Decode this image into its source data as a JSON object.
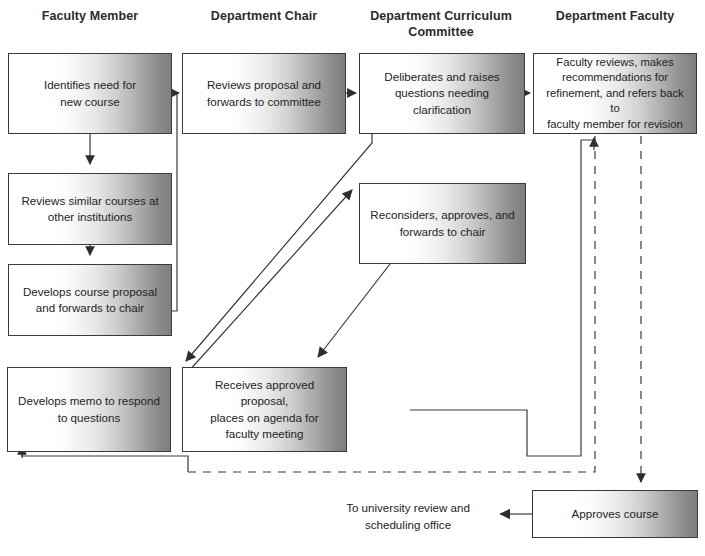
{
  "diagram": {
    "type": "swimlane-flowchart",
    "columns": [
      {
        "id": "faculty-member",
        "label": "Faculty Member",
        "center_x": 90
      },
      {
        "id": "department-chair",
        "label": "Department Chair",
        "center_x": 264
      },
      {
        "id": "department-curriculum-committee",
        "label": "Department Curriculum\nCommittee",
        "center_x": 441
      },
      {
        "id": "department-faculty",
        "label": "Department Faculty",
        "center_x": 615
      }
    ],
    "nodes": [
      {
        "id": "identifies-need",
        "column": "faculty-member",
        "text": "Identifies need for\nnew course",
        "x": 8,
        "y": 53,
        "w": 164,
        "h": 81
      },
      {
        "id": "reviews-similar-courses",
        "column": "faculty-member",
        "text": "Reviews similar courses at\nother institutions",
        "x": 8,
        "y": 173,
        "w": 164,
        "h": 72
      },
      {
        "id": "develops-course-proposal",
        "column": "faculty-member",
        "text": "Develops course proposal\nand forwards to chair",
        "x": 8,
        "y": 264,
        "w": 164,
        "h": 72
      },
      {
        "id": "develops-memo",
        "column": "faculty-member",
        "text": "Develops memo to respond\nto questions",
        "x": 7,
        "y": 367,
        "w": 164,
        "h": 85
      },
      {
        "id": "reviews-proposal",
        "column": "department-chair",
        "text": "Reviews proposal and\nforwards to committee",
        "x": 182,
        "y": 53,
        "w": 164,
        "h": 81
      },
      {
        "id": "receives-approved-proposal",
        "column": "department-chair",
        "text": "Receives approved proposal,\nplaces on agenda for\nfaculty meeting",
        "x": 182,
        "y": 367,
        "w": 165,
        "h": 85
      },
      {
        "id": "deliberates-raises-questions",
        "column": "department-curriculum-committee",
        "text": "Deliberates and raises\nquestions needing\nclarification",
        "x": 359,
        "y": 53,
        "w": 166,
        "h": 81
      },
      {
        "id": "reconsiders-approves",
        "column": "department-curriculum-committee",
        "text": "Reconsiders, approves, and\nforwards to chair",
        "x": 359,
        "y": 183,
        "w": 167,
        "h": 81
      },
      {
        "id": "faculty-reviews",
        "column": "department-faculty",
        "text": "Faculty reviews, makes\nrecommendations for\nrefinement, and refers back to\nfaculty member for revision",
        "x": 533,
        "y": 53,
        "w": 164,
        "h": 81
      },
      {
        "id": "approves-course",
        "column": "department-faculty",
        "text": "Approves course",
        "x": 532,
        "y": 490,
        "w": 166,
        "h": 48
      }
    ],
    "labels": [
      {
        "id": "to-university-review",
        "text": "To university review and\nscheduling office",
        "x": 318,
        "y": 500,
        "w": 180
      }
    ],
    "connectors": [
      {
        "id": "identifies-to-reviews-similar",
        "from": "identifies-need",
        "to": "reviews-similar-courses",
        "style": "solid",
        "arrow": "down"
      },
      {
        "id": "reviews-similar-to-develops-proposal",
        "from": "reviews-similar-courses",
        "to": "develops-course-proposal",
        "style": "solid",
        "arrow": "down"
      },
      {
        "id": "develops-proposal-to-chair",
        "from": "develops-course-proposal",
        "to": "reviews-proposal",
        "style": "solid",
        "arrow": "right"
      },
      {
        "id": "chair-to-committee",
        "from": "reviews-proposal",
        "to": "deliberates-raises-questions",
        "style": "solid",
        "arrow": "right"
      },
      {
        "id": "committee-to-faculty-reviews",
        "from": "deliberates-raises-questions",
        "to": "faculty-reviews",
        "style": "solid",
        "arrow": "right"
      },
      {
        "id": "committee-questions-to-memo",
        "from": "deliberates-raises-questions",
        "to": "develops-memo",
        "style": "solid-diagonal",
        "arrow": "down-left"
      },
      {
        "id": "memo-to-reconsiders",
        "from": "develops-memo",
        "to": "reconsiders-approves",
        "style": "solid-diagonal",
        "arrow": "up-right"
      },
      {
        "id": "reconsiders-to-receives",
        "from": "reconsiders-approves",
        "to": "receives-approved-proposal",
        "style": "solid-diagonal",
        "arrow": "down-left"
      },
      {
        "id": "receives-to-faculty-reviews",
        "from": "receives-approved-proposal",
        "to": "faculty-reviews",
        "style": "solid",
        "arrow": "up"
      },
      {
        "id": "faculty-reviews-back-to-memo",
        "from": "faculty-reviews",
        "to": "develops-memo",
        "style": "dashed",
        "arrow": "up"
      },
      {
        "id": "faculty-reviews-to-approves",
        "from": "faculty-reviews",
        "to": "approves-course",
        "style": "dashed",
        "arrow": "down"
      },
      {
        "id": "approves-to-university-office",
        "from": "approves-course",
        "to": "to-university-review",
        "style": "solid",
        "arrow": "left"
      }
    ],
    "colors": {
      "box_border": "#3a3a3a",
      "box_fill_light": "#ffffff",
      "box_fill_dark": "#7e7e7e",
      "line": "#3a3a3a",
      "text": "#23231f",
      "header_text": "#2b2b2b",
      "background": "#ffffff"
    }
  }
}
